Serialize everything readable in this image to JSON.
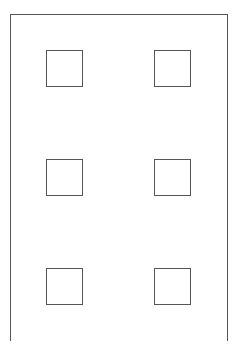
{
  "diagram": {
    "stroke_color": "#555555",
    "background": "#ffffff",
    "frame": {
      "left": 10,
      "top": 14,
      "width": 218,
      "height": 327,
      "open_bottom": true
    },
    "windows": [
      {
        "row": 1,
        "col": 1,
        "x": 46,
        "y": 50,
        "size": 37
      },
      {
        "row": 1,
        "col": 2,
        "x": 154,
        "y": 50,
        "size": 37
      },
      {
        "row": 2,
        "col": 1,
        "x": 46,
        "y": 159,
        "size": 37
      },
      {
        "row": 2,
        "col": 2,
        "x": 154,
        "y": 159,
        "size": 37
      },
      {
        "row": 3,
        "col": 1,
        "x": 46,
        "y": 268,
        "size": 37
      },
      {
        "row": 3,
        "col": 2,
        "x": 154,
        "y": 268,
        "size": 37
      }
    ]
  }
}
